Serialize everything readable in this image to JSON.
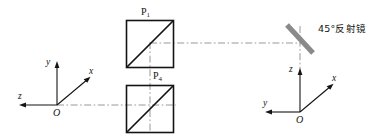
{
  "figure": {
    "type": "optical-schematic-diagram",
    "background_color": "#ffffff",
    "ink_color": "#141414",
    "mirror_color": "#8a8a8a",
    "centerline_color": "#8c8c8c"
  },
  "components": {
    "prism_top": {
      "label": "P",
      "subscript": "1",
      "shape": "square-with-diagonal",
      "diagonal_direction": "bottom-left-to-top-right"
    },
    "prism_bottom": {
      "label": "P",
      "subscript": "4",
      "shape": "square-with-diagonal",
      "diagonal_direction": "bottom-left-to-top-right"
    },
    "mirror": {
      "label": "45°反射镜",
      "angle_degrees": 45,
      "style": "thick-gray-bar"
    }
  },
  "axes_left": {
    "origin_label": "O",
    "vertical_label": "y",
    "diagonal_label": "x",
    "horizontal_label": "z"
  },
  "axes_right": {
    "origin_label": "O",
    "vertical_label": "z",
    "diagonal_label": "x",
    "horizontal_label": "y"
  }
}
